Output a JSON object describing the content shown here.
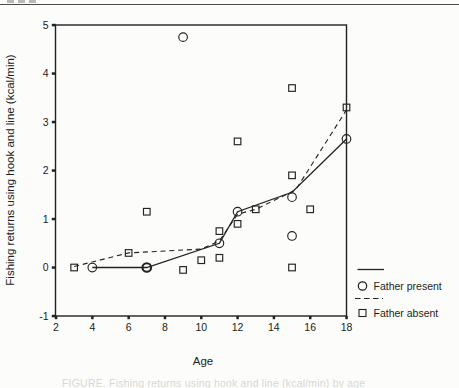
{
  "page": {
    "caption_fragment": "FIGURE. Fishing returns using hook and line (kcal/min) by age"
  },
  "chart_data": {
    "type": "scatter",
    "title": "",
    "xlabel": "Age",
    "ylabel": "Fishing returns using hook and line (kcal/min)",
    "xlim": [
      2,
      18
    ],
    "ylim": [
      -1,
      5
    ],
    "xticks": [
      2,
      4,
      6,
      8,
      10,
      12,
      14,
      16,
      18
    ],
    "yticks": [
      5,
      4,
      3,
      2,
      1,
      0,
      -1
    ],
    "grid": false,
    "legend_position": "outside-bottom-right",
    "frame": "full-box",
    "ink_color": "#222222",
    "series": [
      {
        "name": "Father present",
        "marker": "circle",
        "line": "solid",
        "points": [
          [
            4,
            0
          ],
          [
            7,
            0,
            "bold"
          ],
          [
            9,
            4.75
          ],
          [
            11,
            0.5
          ],
          [
            12,
            1.15
          ],
          [
            15,
            0.65
          ],
          [
            15,
            1.45
          ],
          [
            18,
            2.65
          ]
        ],
        "trend": [
          [
            4,
            0
          ],
          [
            7,
            0
          ],
          [
            11,
            0.5
          ],
          [
            12,
            1.15
          ],
          [
            15,
            1.55
          ],
          [
            18,
            2.65
          ]
        ]
      },
      {
        "name": "Father absent",
        "marker": "square",
        "line": "dashed",
        "points": [
          [
            3,
            0
          ],
          [
            6,
            0.3
          ],
          [
            7,
            1.15
          ],
          [
            9,
            -0.05
          ],
          [
            10,
            0.15
          ],
          [
            11,
            0.2
          ],
          [
            11,
            0.75
          ],
          [
            12,
            0.9
          ],
          [
            12,
            2.6
          ],
          [
            13,
            1.2
          ],
          [
            15,
            0
          ],
          [
            15,
            1.9
          ],
          [
            15,
            3.7
          ],
          [
            16,
            1.2
          ],
          [
            18,
            3.3
          ]
        ],
        "trend": [
          [
            3,
            0.02
          ],
          [
            6,
            0.3
          ],
          [
            10,
            0.38
          ],
          [
            11,
            0.55
          ],
          [
            12,
            1.1
          ],
          [
            13,
            1.2
          ],
          [
            15.2,
            1.6
          ],
          [
            18,
            3.25
          ]
        ]
      }
    ]
  }
}
